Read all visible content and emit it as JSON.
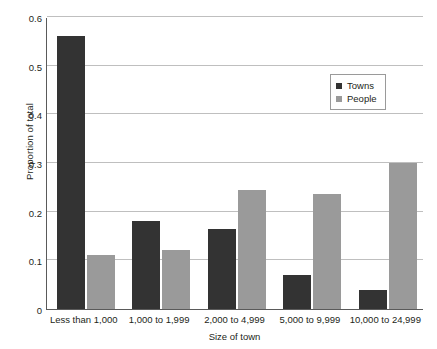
{
  "chart_data": {
    "type": "bar",
    "title": "",
    "xlabel": "Size of town",
    "ylabel": "Proportion of total",
    "categories": [
      "Less than 1,000",
      "1,000 to 1,999",
      "2,000 to 4,999",
      "5,000 to 9,999",
      "10,000 to 24,999"
    ],
    "series": [
      {
        "name": "Towns",
        "color": "#333333",
        "values": [
          0.56,
          0.18,
          0.165,
          0.07,
          0.04
        ]
      },
      {
        "name": "People",
        "color": "#9a9a9a",
        "values": [
          0.11,
          0.122,
          0.245,
          0.237,
          0.3
        ]
      }
    ],
    "ylim": [
      0,
      0.6
    ],
    "yticks": [
      0,
      0.1,
      0.2,
      0.3,
      0.4,
      0.5,
      0.6
    ],
    "ytick_labels": [
      "0",
      "0.1",
      "0.2",
      "0.3",
      "0.4",
      "0.5",
      "0.6"
    ],
    "grid": "horizontal",
    "legend_position": "upper-right",
    "grid_color": "#bfbfbf",
    "axis_color": "#5a5a5a"
  }
}
